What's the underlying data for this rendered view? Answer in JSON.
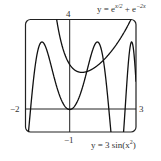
{
  "chart_data": {
    "type": "line",
    "title": "",
    "xlim": [
      -2,
      3
    ],
    "ylim": [
      -1,
      4
    ],
    "grid": false,
    "series": [
      {
        "name": "y = e^{x/2} + e^{-2x}",
        "expr": "exp(x/2)+exp(-2x)"
      },
      {
        "name": "y = 3 sin(x^2)",
        "expr": "3*sin(x^2)"
      }
    ],
    "tick_labels": {
      "x_left": "−2",
      "x_right": "3",
      "y_top": "4",
      "y_bottom": "−1"
    }
  },
  "labels": {
    "curve1": "y = e",
    "curve1_exp1": "x/2",
    "curve1_plus": " + e",
    "curve1_exp2": "−2x",
    "curve2": "y = 3 sin(x",
    "curve2_sup": "2",
    "curve2_end": ")",
    "x_min": "−2",
    "x_max": "3",
    "y_max": "4",
    "y_min": "−1"
  }
}
